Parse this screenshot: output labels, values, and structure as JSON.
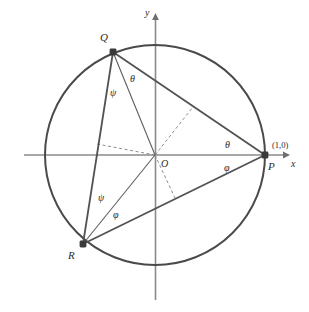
{
  "figure": {
    "type": "geometry-diagram",
    "canvas": {
      "width": 309,
      "height": 312,
      "background": "#ffffff"
    },
    "colors": {
      "circle_stroke": "#4a4a4a",
      "chord_stroke": "#5a5a5a",
      "axis_stroke": "#8a8a8a",
      "dashed_stroke": "#8d8d8d",
      "point_fill": "#3a3a3a",
      "label_color": "#2b2b2b"
    },
    "circle": {
      "cx": 155,
      "cy": 155,
      "r": 110,
      "stroke_width": 2.0
    },
    "axes": {
      "x": {
        "x1": 24,
        "y1": 155,
        "x2": 288,
        "y2": 155,
        "arrow": "right",
        "label": "x"
      },
      "y": {
        "x1": 155.5,
        "y1": 14,
        "x2": 155.5,
        "y2": 300,
        "arrow": "up",
        "label": "y"
      }
    },
    "points": [
      {
        "id": "Q",
        "label": "Q",
        "cx": 113,
        "cy": 52,
        "label_x": 100,
        "label_y": 32
      },
      {
        "id": "R",
        "label": "R",
        "cx": 83,
        "cy": 244,
        "label_x": 68,
        "label_y": 250
      },
      {
        "id": "P",
        "label": "P",
        "cx": 265,
        "cy": 155,
        "label_x": 268,
        "label_y": 161
      },
      {
        "id": "O",
        "label": "O",
        "cx": 155,
        "cy": 155,
        "label_x": 161,
        "label_y": 159
      }
    ],
    "point_coord_label": {
      "text": "(1,0)",
      "x": 272,
      "y": 141
    },
    "chords": [
      {
        "id": "QP",
        "x1": 113,
        "y1": 52,
        "x2": 265,
        "y2": 155
      },
      {
        "id": "QR",
        "x1": 113,
        "y1": 52,
        "x2": 83,
        "y2": 244
      },
      {
        "id": "RP",
        "x1": 83,
        "y1": 244,
        "x2": 265,
        "y2": 155
      },
      {
        "id": "QO",
        "x1": 113,
        "y1": 52,
        "x2": 155,
        "y2": 155
      },
      {
        "id": "RO",
        "x1": 83,
        "y1": 244,
        "x2": 155,
        "y2": 155
      }
    ],
    "dashed_lines": [
      {
        "id": "O-to-QR-foot",
        "x1": 155,
        "y1": 155,
        "x2": 97,
        "y2": 144
      },
      {
        "id": "O-to-QP-foot",
        "x1": 155,
        "y1": 155,
        "x2": 193,
        "y2": 107
      },
      {
        "id": "O-to-RP-foot",
        "x1": 155,
        "y1": 155,
        "x2": 175,
        "y2": 198
      }
    ],
    "angle_labels": [
      {
        "id": "theta-at-Q",
        "text": "θ",
        "x": 130,
        "y": 74
      },
      {
        "id": "psi-at-Q",
        "text": "ψ",
        "x": 110,
        "y": 88
      },
      {
        "id": "psi-at-R",
        "text": "ψ",
        "x": 98,
        "y": 193
      },
      {
        "id": "phi-at-R",
        "text": "φ",
        "x": 113,
        "y": 210
      },
      {
        "id": "theta-at-P",
        "text": "θ",
        "x": 225,
        "y": 140
      },
      {
        "id": "phi-at-P",
        "text": "φ",
        "x": 224,
        "y": 163
      }
    ]
  }
}
